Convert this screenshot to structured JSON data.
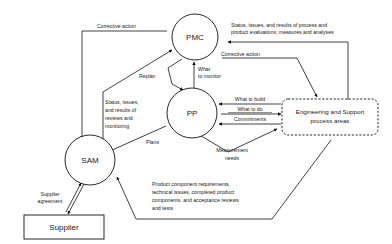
{
  "diagram": {
    "background_color": "#ffffff",
    "line_color": "#111111",
    "text_color": "#1a1a1a"
  },
  "nodes": {
    "pmc": {
      "label": "PMC",
      "shape": "circle"
    },
    "pp": {
      "label": "PP",
      "shape": "circle"
    },
    "sam": {
      "label": "SAM",
      "shape": "circle"
    },
    "supplier": {
      "label": "Supplier",
      "shape": "rectangle"
    },
    "engineering": {
      "label_line1": "Engineering and Support",
      "label_line2": "process areas",
      "shape": "rounded-dashed-rectangle"
    }
  },
  "edges": {
    "corrective_action_to_sam": "Corrective action",
    "corrective_action_from_engineering": "Corrective action",
    "status_issues_process": {
      "line1": "Status, issues, and results of process and",
      "line2": "product evaluations; measures and analyses"
    },
    "replan": "Replan",
    "what_to_monitor": {
      "line1": "What",
      "line2": "to monitor"
    },
    "what_to_build": "What to build",
    "what_to_do": "What to do",
    "commitments": "Commitments",
    "status_issues_reviews": {
      "line1": "Status, issues,",
      "line2": "and results of",
      "line3": "reviews and",
      "line4": "monitoring"
    },
    "plans": "Plans",
    "measurement_needs": {
      "line1": "Measurement",
      "line2": "needs"
    },
    "supplier_agreement": {
      "line1": "Supplier",
      "line2": "agreement"
    },
    "product_component": {
      "line1": "Product component requirements,",
      "line2": "technical issues, completed product",
      "line3": "components, and acceptance reviews",
      "line4": "and tests"
    }
  }
}
